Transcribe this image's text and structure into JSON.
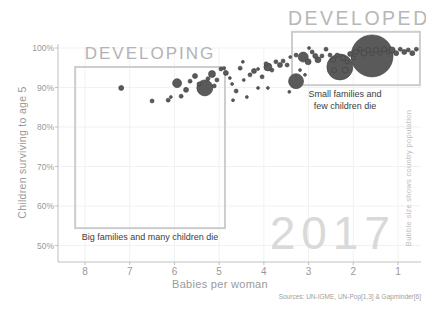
{
  "chart_data": {
    "type": "scatter",
    "title_right": "DEVELOPED",
    "title_left": "DEVELOPING",
    "year_watermark": "2017",
    "xlabel": "Babies per woman",
    "ylabel": "Children surviving to age 5",
    "right_note": "Bubble size shows country population",
    "sources": "Sources: UN-IGME, UN-Pop[1,3] & Gapminder[6]",
    "x_ticks": [
      8,
      7,
      6,
      5,
      4,
      3,
      2,
      1
    ],
    "x_axis_reversed": true,
    "y_ticks": [
      100,
      90,
      80,
      70,
      60,
      50
    ],
    "y_tick_labels": [
      "100%",
      "90%",
      "80%",
      "70%",
      "60%",
      "50%"
    ],
    "x_range": [
      8.6,
      0.5
    ],
    "y_range": [
      50,
      100
    ],
    "grid": true,
    "legend_position": "none",
    "annotations": {
      "developed_line1": "Small families and",
      "developed_line2": "few children die",
      "developing_line": "Big families and many children die"
    },
    "regions": [
      {
        "name": "developing",
        "label": "DEVELOPING",
        "x_from": 8.22,
        "x_to": 4.87,
        "y_top": 95.2,
        "y_bottom": 54.4
      },
      {
        "name": "developed",
        "label": "DEVELOPED",
        "x_from": 3.37,
        "x_to": 0.51,
        "y_top": 104.1,
        "y_bottom": 90.6
      }
    ],
    "bubble_format": [
      "babies_per_woman",
      "pct_children_surviving_to_age_5",
      "radius_px"
    ],
    "bubbles": [
      [
        7.19,
        89.9,
        2.5
      ],
      [
        6.5,
        86.6,
        2
      ],
      [
        6.14,
        86.8,
        2
      ],
      [
        6.08,
        87.6,
        1.5
      ],
      [
        5.94,
        91.1,
        4.5
      ],
      [
        5.85,
        87.8,
        2
      ],
      [
        5.74,
        89.4,
        2.5
      ],
      [
        5.65,
        91.6,
        2
      ],
      [
        5.54,
        92.9,
        2.5
      ],
      [
        5.45,
        90.9,
        2
      ],
      [
        5.32,
        89.9,
        8
      ],
      [
        5.25,
        92.2,
        2
      ],
      [
        5.16,
        93.4,
        3.5
      ],
      [
        5.11,
        90.4,
        2
      ],
      [
        5.05,
        91.9,
        2
      ],
      [
        4.96,
        94.7,
        2
      ],
      [
        4.89,
        94.9,
        1.5
      ],
      [
        4.85,
        93.7,
        2.5
      ],
      [
        4.76,
        92.4,
        1.5
      ],
      [
        4.71,
        90.9,
        1.5
      ],
      [
        4.69,
        86.8,
        1.5
      ],
      [
        4.62,
        89.1,
        2
      ],
      [
        4.53,
        94.9,
        2
      ],
      [
        4.47,
        96.5,
        1.5
      ],
      [
        4.45,
        91.9,
        1.5
      ],
      [
        4.38,
        87.6,
        1.5
      ],
      [
        4.31,
        93.2,
        2
      ],
      [
        4.22,
        94.2,
        2.5
      ],
      [
        4.13,
        89.9,
        1.5
      ],
      [
        4.13,
        94.7,
        1.5
      ],
      [
        4.04,
        92.7,
        2
      ],
      [
        3.95,
        96.0,
        2
      ],
      [
        3.91,
        95.2,
        4
      ],
      [
        3.91,
        89.9,
        1.5
      ],
      [
        3.82,
        94.4,
        2
      ],
      [
        3.73,
        96.5,
        2
      ],
      [
        3.64,
        95.7,
        2.5
      ],
      [
        3.57,
        96.7,
        2
      ],
      [
        3.48,
        95.7,
        2
      ],
      [
        3.43,
        88.9,
        1.5
      ],
      [
        3.41,
        97.7,
        1.5
      ],
      [
        3.28,
        91.6,
        7.5
      ],
      [
        3.28,
        98.2,
        2
      ],
      [
        3.19,
        94.4,
        1.5
      ],
      [
        3.12,
        97.7,
        5
      ],
      [
        3.08,
        93.2,
        1.5
      ],
      [
        3.01,
        96.5,
        3
      ],
      [
        2.99,
        100.0,
        1.5
      ],
      [
        2.92,
        99.0,
        2
      ],
      [
        2.85,
        98.0,
        2.5
      ],
      [
        2.79,
        97.0,
        3
      ],
      [
        2.7,
        98.0,
        2
      ],
      [
        2.61,
        99.7,
        2
      ],
      [
        2.52,
        98.2,
        2
      ],
      [
        2.45,
        97.0,
        2.5
      ],
      [
        2.43,
        94.4,
        2.5
      ],
      [
        2.36,
        98.2,
        2
      ],
      [
        2.3,
        95.2,
        13
      ],
      [
        2.23,
        97.5,
        2.5
      ],
      [
        2.18,
        94.4,
        3
      ],
      [
        2.14,
        96.5,
        2
      ],
      [
        2.07,
        98.5,
        2.5
      ],
      [
        2.0,
        97.5,
        2
      ],
      [
        1.94,
        99.0,
        2.5
      ],
      [
        1.85,
        99.7,
        2
      ],
      [
        1.76,
        98.7,
        3
      ],
      [
        1.67,
        99.5,
        2.5
      ],
      [
        1.58,
        98.0,
        21
      ],
      [
        1.58,
        98.5,
        2
      ],
      [
        1.49,
        99.5,
        2.5
      ],
      [
        1.4,
        98.7,
        2
      ],
      [
        1.31,
        99.7,
        2.5
      ],
      [
        1.22,
        99.0,
        2
      ],
      [
        1.13,
        99.5,
        3
      ],
      [
        1.04,
        98.7,
        2.5
      ],
      [
        0.95,
        99.7,
        2
      ],
      [
        0.86,
        99.0,
        2.5
      ],
      [
        0.77,
        99.5,
        2
      ],
      [
        0.68,
        98.7,
        2.5
      ],
      [
        0.59,
        99.7,
        2
      ]
    ],
    "colors": {
      "bubble_fill": "#5a5a5a",
      "bubble_stroke": "#404040",
      "region_border": "#cdcdcd",
      "axis": "#c0c0c0",
      "gridline": "#f1f1f1",
      "tick_text": "#999999",
      "muted_title": "#b5b5b5",
      "watermark": "#d9d9d9",
      "background": "#ffffff"
    }
  }
}
